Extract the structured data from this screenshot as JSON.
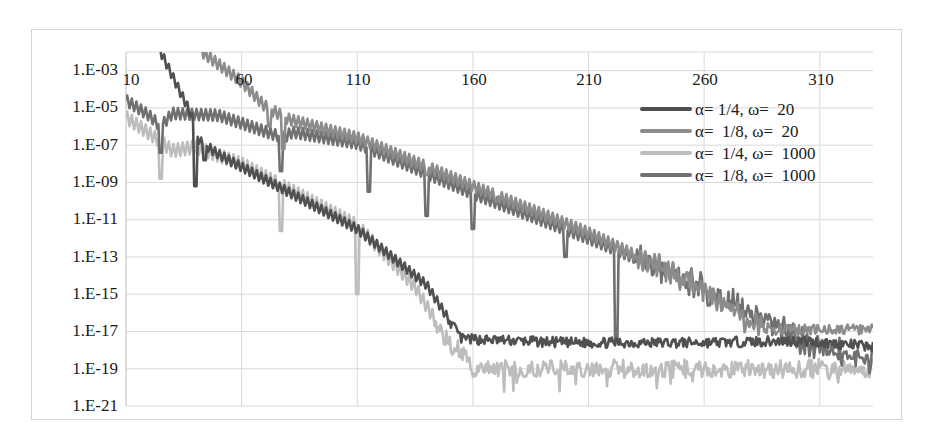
{
  "chart_data": {
    "type": "line",
    "title": "",
    "xlabel": "",
    "ylabel": "",
    "yscale": "log",
    "xlim": [
      10,
      333
    ],
    "ylim": [
      1e-21,
      0.01
    ],
    "grid": true,
    "legend_position": "upper-right (inside plot)",
    "x_ticks": [
      "10",
      "60",
      "110",
      "160",
      "210",
      "260",
      "310"
    ],
    "x_tick_values": [
      10,
      60,
      110,
      160,
      210,
      260,
      310
    ],
    "y_ticks": [
      "1.E-03",
      "1.E-05",
      "1.E-07",
      "1.E-09",
      "1.E-11",
      "1.E-13",
      "1.E-15",
      "1.E-17",
      "1.E-19",
      "1.E-21"
    ],
    "y_tick_exponents": [
      -3,
      -5,
      -7,
      -9,
      -11,
      -13,
      -15,
      -17,
      -19,
      -21
    ],
    "series": [
      {
        "name": "α= 1/4, ω=  20",
        "color": "#505050",
        "log10_points": [
          [
            25,
            -2.0
          ],
          [
            38,
            -5.3
          ],
          [
            40,
            -6.3
          ],
          [
            42,
            -6.8
          ],
          [
            50,
            -7.5
          ],
          [
            80,
            -9.5
          ],
          [
            110,
            -11.5
          ],
          [
            140,
            -14.5
          ],
          [
            155,
            -17.4
          ],
          [
            200,
            -17.6
          ],
          [
            260,
            -17.6
          ],
          [
            300,
            -17.5
          ],
          [
            333,
            -17.8
          ]
        ],
        "ripple": 0.25,
        "notches": [
          [
            40,
            -9.2
          ],
          [
            44,
            -7.8
          ]
        ]
      },
      {
        "name": "α=  1/8, ω=  20",
        "color": "#8c8c8c",
        "log10_points": [
          [
            43,
            -2.0
          ],
          [
            60,
            -3.6
          ],
          [
            70,
            -4.9
          ],
          [
            80,
            -5.6
          ],
          [
            110,
            -6.6
          ],
          [
            160,
            -9.2
          ],
          [
            210,
            -11.7
          ],
          [
            260,
            -14.7
          ],
          [
            280,
            -16.6
          ],
          [
            290,
            -16.9
          ],
          [
            333,
            -16.9
          ]
        ],
        "ripple": 0.3,
        "notches": [
          [
            72,
            -6.0
          ],
          [
            78,
            -7.2
          ],
          [
            140,
            -8.6
          ],
          [
            170,
            -10.0
          ]
        ]
      },
      {
        "name": "α=  1/4, ω=  1000",
        "color": "#bdbdbd",
        "log10_points": [
          [
            10,
            -5.5
          ],
          [
            25,
            -6.8
          ],
          [
            30,
            -7.3
          ],
          [
            40,
            -7.1
          ],
          [
            60,
            -8.0
          ],
          [
            75,
            -9.0
          ],
          [
            110,
            -11.3
          ],
          [
            135,
            -14.6
          ],
          [
            150,
            -17.7
          ],
          [
            157,
            -18.2
          ],
          [
            160,
            -19.0
          ],
          [
            200,
            -19.0
          ],
          [
            260,
            -19.0
          ],
          [
            333,
            -19.0
          ]
        ],
        "ripple": 0.35,
        "notches": [
          [
            25,
            -8.8
          ],
          [
            77,
            -11.6
          ],
          [
            110,
            -15.0
          ],
          [
            155,
            -17.8
          ]
        ]
      },
      {
        "name": "α=  1/8, ω=  1000",
        "color": "#707070",
        "log10_points": [
          [
            10,
            -4.6
          ],
          [
            20,
            -5.4
          ],
          [
            25,
            -6.0
          ],
          [
            30,
            -5.3
          ],
          [
            50,
            -5.4
          ],
          [
            78,
            -6.6
          ],
          [
            82,
            -6.3
          ],
          [
            110,
            -6.9
          ],
          [
            160,
            -9.6
          ],
          [
            210,
            -12.0
          ],
          [
            260,
            -14.6
          ],
          [
            300,
            -17.4
          ],
          [
            333,
            -18.6
          ]
        ],
        "ripple": 0.3,
        "notches": [
          [
            25,
            -7.4
          ],
          [
            77,
            -8.4
          ],
          [
            115,
            -9.5
          ],
          [
            140,
            -10.8
          ],
          [
            160,
            -11.5
          ],
          [
            200,
            -13.0
          ],
          [
            222,
            -17.5
          ],
          [
            262,
            -15.6
          ]
        ]
      }
    ]
  },
  "legend": {
    "items": [
      {
        "label": "α= 1/4, ω=  20",
        "color": "#505050"
      },
      {
        "label": "α=  1/8, ω=  20",
        "color": "#8c8c8c"
      },
      {
        "label": "α=  1/4, ω=  1000",
        "color": "#bdbdbd"
      },
      {
        "label": "α=  1/8, ω=  1000",
        "color": "#707070"
      }
    ]
  },
  "axes": {
    "y_labels": [
      "1.E-03",
      "1.E-05",
      "1.E-07",
      "1.E-09",
      "1.E-11",
      "1.E-13",
      "1.E-15",
      "1.E-17",
      "1.E-19",
      "1.E-21"
    ],
    "x_labels": [
      "10",
      "60",
      "110",
      "160",
      "210",
      "260",
      "310"
    ]
  }
}
